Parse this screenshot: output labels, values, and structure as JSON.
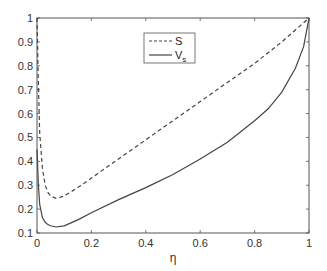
{
  "chart_data": {
    "type": "line",
    "title": "",
    "xlabel": "η",
    "ylabel": "",
    "xlim": [
      0,
      1
    ],
    "ylim": [
      0.1,
      1
    ],
    "grid": false,
    "legend_position": "upper center (inside)",
    "x_ticks": [
      "0",
      "0.2",
      "0.4",
      "0.6",
      "0.8",
      "1"
    ],
    "y_ticks": [
      "0.1",
      "0.2",
      "0.3",
      "0.4",
      "0.5",
      "0.6",
      "0.7",
      "0.8",
      "0.9",
      "1"
    ],
    "series": [
      {
        "name": "S",
        "style": "dashed",
        "color": "#444444",
        "x": [
          0.0,
          0.005,
          0.01,
          0.02,
          0.03,
          0.04,
          0.05,
          0.07,
          0.1,
          0.15,
          0.2,
          0.3,
          0.4,
          0.5,
          0.6,
          0.7,
          0.8,
          0.9,
          1.0
        ],
        "values": [
          1.0,
          0.72,
          0.52,
          0.37,
          0.3,
          0.27,
          0.255,
          0.245,
          0.255,
          0.29,
          0.33,
          0.41,
          0.49,
          0.57,
          0.65,
          0.73,
          0.81,
          0.9,
          1.0
        ]
      },
      {
        "name": "V_s",
        "style": "solid",
        "color": "#444444",
        "x": [
          0.0,
          0.005,
          0.01,
          0.02,
          0.03,
          0.04,
          0.05,
          0.07,
          0.1,
          0.15,
          0.2,
          0.3,
          0.4,
          0.5,
          0.6,
          0.7,
          0.8,
          0.85,
          0.9,
          0.95,
          0.98,
          1.0
        ],
        "values": [
          0.45,
          0.3,
          0.22,
          0.165,
          0.145,
          0.135,
          0.13,
          0.125,
          0.13,
          0.155,
          0.185,
          0.24,
          0.29,
          0.345,
          0.41,
          0.48,
          0.57,
          0.62,
          0.69,
          0.79,
          0.88,
          1.0
        ]
      }
    ]
  },
  "legend": {
    "items": [
      {
        "label": "S",
        "subscript": ""
      },
      {
        "label": "V",
        "subscript": "s"
      }
    ]
  },
  "axes": {
    "xlabel": "η"
  }
}
